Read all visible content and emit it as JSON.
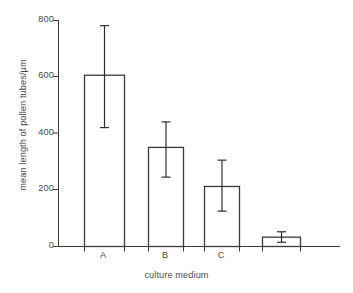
{
  "chart_data": {
    "type": "bar",
    "title": "",
    "subtitle": "",
    "xlabel": "culture medium",
    "ylabel": "mean length of pollen tubes/µm",
    "categories": [
      "A",
      "B",
      "C",
      ""
    ],
    "values": [
      605,
      350,
      212,
      33
    ],
    "errors_low": [
      420,
      245,
      125,
      15
    ],
    "errors_high": [
      780,
      440,
      305,
      52
    ],
    "ylim": [
      0,
      800
    ],
    "yticks": [
      0,
      200,
      400,
      600,
      800
    ],
    "ytick_labels": [
      "0",
      "200",
      "400",
      "600",
      "800"
    ],
    "grid": false,
    "legend": false,
    "legend_position": "none",
    "bar_fill": "#ffffff",
    "bar_edge_color": "#3a3a3a",
    "axis_color": "#3a3a3a",
    "error_bar_color": "#2e2e2e",
    "annotations": []
  },
  "labels": {
    "ytick_0": "0",
    "ytick_1": "200",
    "ytick_2": "400",
    "ytick_3": "600",
    "ytick_4": "800",
    "cat_0": "A",
    "cat_1": "B",
    "cat_2": "C",
    "cat_3": "",
    "xaxis_title": "culture medium",
    "yaxis_title": "mean length of pollen tubes/µm"
  }
}
